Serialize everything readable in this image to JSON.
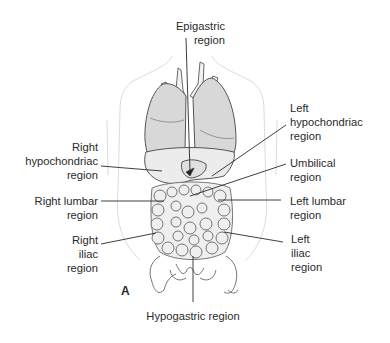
{
  "figure": {
    "panel_letter": "A",
    "labels": {
      "epigastric": [
        "Epigastric",
        "region"
      ],
      "left_hypochondriac": [
        "Left",
        "hypochondriac",
        "region"
      ],
      "right_hypochondriac": [
        "Right",
        "hypochondriac",
        "region"
      ],
      "umbilical": [
        "Umbilical",
        "region"
      ],
      "right_lumbar": [
        "Right lumbar",
        "region"
      ],
      "left_lumbar": [
        "Left lumbar",
        "region"
      ],
      "right_iliac": [
        "Right",
        "iliac",
        "region"
      ],
      "left_iliac": [
        "Left",
        "iliac",
        "region"
      ],
      "hypogastric": [
        "Hypogastric region"
      ]
    },
    "colors": {
      "line": "#2a2a2a",
      "outline": "#d8d8d8",
      "organ_fill": "#e6e6e6",
      "lung_fill": "#d9d9d9"
    }
  }
}
